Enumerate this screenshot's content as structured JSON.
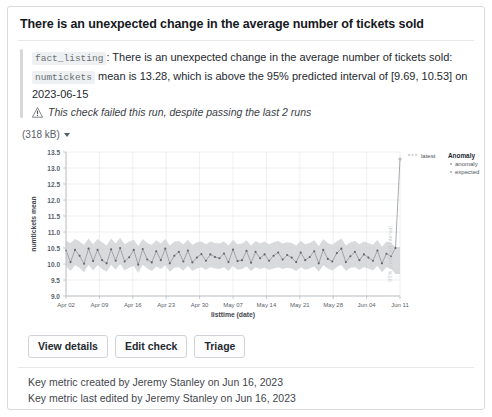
{
  "card": {
    "title": "There is an unexpected change in the average number of tickets sold",
    "description": {
      "table_token": "fact_listing",
      "lead": ": There is an unexpected change in the average number of tickets sold:",
      "column_token": "numtickets",
      "detail": "mean is 13.28, which is above the 95% predicted interval of [9.69, 10.53] on 2023-06-15",
      "failure_note": "This check failed this run, despite passing the last 2 runs",
      "warn_icon": "exclamation-warning-icon"
    },
    "size_dropdown": {
      "label": "(318 kB)",
      "caret_icon": "chevron-down-icon"
    },
    "buttons": [
      {
        "name": "view-details",
        "label": "View details"
      },
      {
        "name": "edit-check",
        "label": "Edit check"
      },
      {
        "name": "triage",
        "label": "Triage"
      }
    ],
    "footer": [
      "Key metric created by Jeremy Stanley on Jun 16, 2023",
      "Key metric last edited by Jeremy Stanley on Jun 16, 2023"
    ]
  },
  "colors": {
    "band": "#d2d4d6",
    "line": "#8f959b",
    "marker": "#5e656c",
    "anomaly": "#b9bec3",
    "grid": "#e9ebec",
    "axis": "#b7bcc1",
    "text": "#57606a"
  },
  "chart_data": {
    "type": "line",
    "title": "",
    "xlabel": "listtime (date)",
    "ylabel": "numtickets mean",
    "ylim": [
      9.0,
      13.5
    ],
    "yticks": [
      9.0,
      9.5,
      10.0,
      10.5,
      11.0,
      11.5,
      12.0,
      12.5,
      13.0,
      13.5
    ],
    "ytick_labels": [
      "9.0",
      "9.5",
      "10.0",
      "10.5",
      "11.0",
      "11.5",
      "12.0",
      "12.5",
      "13.0",
      "13.5"
    ],
    "xtick_labels": [
      "Apr 02",
      "Apr 09",
      "Apr 16",
      "Apr 23",
      "Apr 30",
      "May 07",
      "May 14",
      "May 21",
      "May 28",
      "Jun 04",
      "Jun 11"
    ],
    "grid": true,
    "annotation": "95% predicted interval",
    "legend_position": "right",
    "legend": {
      "latest_label": "latest",
      "anomaly_title": "Anomaly",
      "anomaly_items": [
        "anomaly",
        "expected"
      ]
    },
    "series": [
      {
        "name": "numtickets mean",
        "values": [
          10.42,
          10.06,
          10.44,
          10.26,
          10.01,
          10.48,
          10.09,
          10.44,
          10.12,
          10.02,
          10.46,
          10.1,
          10.5,
          10.08,
          10.21,
          10.44,
          9.98,
          10.47,
          10.14,
          10.05,
          10.4,
          10.12,
          10.48,
          10.02,
          10.26,
          10.38,
          10.08,
          10.42,
          10.05,
          10.2,
          10.31,
          10.1,
          10.3,
          10.22,
          10.18,
          10.33,
          10.06,
          10.45,
          10.09,
          10.12,
          10.41,
          10.04,
          10.38,
          10.18,
          10.3,
          10.1,
          10.26,
          10.36,
          10.14,
          10.28,
          10.2,
          10.06,
          10.36,
          10.12,
          10.22,
          10.4,
          10.02,
          10.44,
          10.16,
          10.08,
          10.34,
          10.48,
          10.06,
          10.24,
          10.38,
          10.12,
          10.3,
          10.2,
          10.1,
          10.42,
          10.02,
          10.32,
          10.24,
          10.5,
          13.28
        ]
      },
      {
        "name": "band_upper",
        "values": [
          10.72,
          10.66,
          10.78,
          10.7,
          10.6,
          10.8,
          10.62,
          10.78,
          10.68,
          10.58,
          10.8,
          10.64,
          10.82,
          10.62,
          10.7,
          10.76,
          10.56,
          10.78,
          10.66,
          10.6,
          10.74,
          10.64,
          10.78,
          10.58,
          10.7,
          10.72,
          10.62,
          10.76,
          10.6,
          10.68,
          10.7,
          10.62,
          10.7,
          10.66,
          10.64,
          10.7,
          10.58,
          10.76,
          10.62,
          10.64,
          10.74,
          10.58,
          10.72,
          10.64,
          10.7,
          10.62,
          10.68,
          10.72,
          10.64,
          10.68,
          10.66,
          10.58,
          10.72,
          10.62,
          10.66,
          10.74,
          10.56,
          10.78,
          10.66,
          10.6,
          10.7,
          10.8,
          10.58,
          10.68,
          10.72,
          10.62,
          10.7,
          10.66,
          10.6,
          10.76,
          10.54,
          10.7,
          10.66,
          10.53,
          10.53
        ]
      },
      {
        "name": "band_lower",
        "values": [
          9.94,
          9.78,
          9.96,
          9.88,
          9.74,
          9.98,
          9.8,
          9.96,
          9.84,
          9.76,
          9.98,
          9.82,
          10.0,
          9.8,
          9.88,
          9.94,
          9.72,
          9.98,
          9.86,
          9.78,
          9.92,
          9.84,
          9.96,
          9.76,
          9.88,
          9.9,
          9.8,
          9.94,
          9.78,
          9.86,
          9.9,
          9.82,
          9.9,
          9.86,
          9.84,
          9.9,
          9.78,
          9.94,
          9.82,
          9.84,
          9.92,
          9.78,
          9.9,
          9.84,
          9.88,
          9.82,
          9.86,
          9.9,
          9.84,
          9.88,
          9.86,
          9.78,
          9.9,
          9.82,
          9.86,
          9.92,
          9.76,
          9.96,
          9.86,
          9.8,
          9.9,
          9.98,
          9.78,
          9.88,
          9.9,
          9.82,
          9.9,
          9.86,
          9.8,
          9.94,
          9.74,
          9.9,
          9.86,
          9.69,
          9.69
        ]
      }
    ]
  }
}
